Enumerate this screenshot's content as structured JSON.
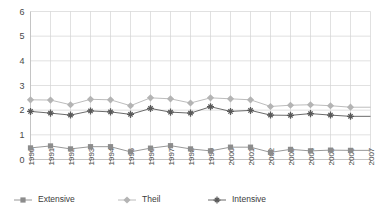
{
  "chart_data": {
    "type": "line",
    "title": "",
    "subtitle": "",
    "xlabel": "",
    "ylabel": "",
    "ylim": [
      0,
      6
    ],
    "y_ticks": [
      0,
      1,
      2,
      3,
      4,
      5,
      6
    ],
    "grid": true,
    "legend_position": "bottom",
    "categories": [
      "1990",
      "1991",
      "1992",
      "1993",
      "1994",
      "1995",
      "1996",
      "1997",
      "1998",
      "1999",
      "2000",
      "2001",
      "2002",
      "2003",
      "2004",
      "2005",
      "2006",
      "2007"
    ],
    "series": [
      {
        "name": "Extensive",
        "marker": "square",
        "color": "#8c8c8c",
        "values": [
          0.47,
          0.55,
          0.43,
          0.52,
          0.52,
          0.31,
          0.46,
          0.56,
          0.43,
          0.35,
          0.5,
          0.5,
          0.29,
          0.41,
          0.35,
          0.38,
          0.37,
          null
        ]
      },
      {
        "name": "Theil",
        "marker": "diamond",
        "color": "#b4b4b4",
        "values": [
          2.42,
          2.41,
          2.22,
          2.44,
          2.42,
          2.18,
          2.5,
          2.46,
          2.29,
          2.5,
          2.46,
          2.42,
          2.15,
          2.2,
          2.22,
          2.18,
          2.12,
          null
        ]
      },
      {
        "name": "Intensive",
        "marker": "plus",
        "color": "#5a5a5a",
        "values": [
          1.95,
          1.88,
          1.8,
          1.97,
          1.93,
          1.83,
          2.07,
          1.92,
          1.88,
          2.14,
          1.95,
          1.99,
          1.8,
          1.79,
          1.86,
          1.8,
          1.75,
          null
        ]
      }
    ]
  },
  "legend": {
    "items": [
      {
        "label": "Extensive",
        "marker": "square-marker",
        "color": "#8c8c8c"
      },
      {
        "label": "Theil",
        "marker": "diamond-marker",
        "color": "#b4b4b4"
      },
      {
        "label": "Intensive",
        "marker": "plus-marker",
        "color": "#5a5a5a"
      }
    ]
  }
}
